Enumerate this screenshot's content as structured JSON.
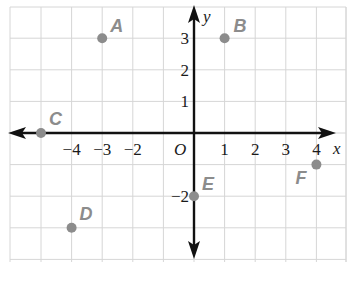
{
  "chart_data": {
    "type": "scatter",
    "title": "",
    "xlabel": "x",
    "ylabel": "y",
    "origin_label": "O",
    "xlim": [
      -6,
      5
    ],
    "ylim": [
      -4,
      4
    ],
    "grid": true,
    "x_tick_labels": [
      {
        "value": -4,
        "label": "−4"
      },
      {
        "value": -3,
        "label": "−3"
      },
      {
        "value": -2,
        "label": "−2"
      },
      {
        "value": 1,
        "label": "1"
      },
      {
        "value": 2,
        "label": "2"
      },
      {
        "value": 3,
        "label": "3"
      },
      {
        "value": 4,
        "label": "4"
      }
    ],
    "y_tick_labels": [
      {
        "value": 3,
        "label": "3"
      },
      {
        "value": 2,
        "label": "2"
      },
      {
        "value": 1,
        "label": "1"
      },
      {
        "value": -2,
        "label": "−2"
      }
    ],
    "points": [
      {
        "name": "A",
        "x": -3,
        "y": 3
      },
      {
        "name": "B",
        "x": 1,
        "y": 3
      },
      {
        "name": "C",
        "x": -5,
        "y": 0
      },
      {
        "name": "D",
        "x": -4,
        "y": -3
      },
      {
        "name": "E",
        "x": 0,
        "y": -2
      },
      {
        "name": "F",
        "x": 4,
        "y": -1
      }
    ],
    "colors": {
      "grid": "#d6d6d6",
      "axis": "#111111",
      "point": "#8c8c8c",
      "point_label": "#8c8c8c"
    }
  }
}
